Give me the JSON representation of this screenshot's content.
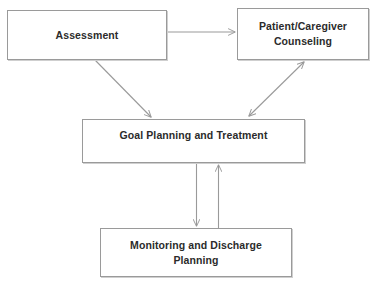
{
  "diagram": {
    "type": "flowchart",
    "canvas": {
      "width": 377,
      "height": 291,
      "background": "#ffffff"
    },
    "style": {
      "box_border_color": "#9a9a9a",
      "box_fill_color": "#ffffff",
      "box_shadow_color": "#cfcfcf",
      "text_color": "#2b2b2b",
      "arrow_color": "#9a9a9a"
    },
    "nodes": [
      {
        "id": "assessment",
        "label": "Assessment",
        "lines": [
          "Assessment"
        ],
        "x": 7,
        "y": 10,
        "width": 160,
        "height": 50
      },
      {
        "id": "counseling",
        "label": "Patient/Caregiver Counseling",
        "lines": [
          "Patient/Caregiver",
          "Counseling"
        ],
        "line1": "Patient/Caregiver",
        "line2": "Counseling",
        "x": 237,
        "y": 8,
        "width": 132,
        "height": 52
      },
      {
        "id": "goal-planning",
        "label": "Goal Planning and Treatment",
        "lines": [
          "Goal Planning and Treatment"
        ],
        "x": 82,
        "y": 119,
        "width": 223,
        "height": 44
      },
      {
        "id": "monitoring",
        "label": "Monitoring and Discharge Planning",
        "lines": [
          "Monitoring and Discharge",
          "Planning"
        ],
        "line1": "Monitoring and Discharge",
        "line2": "Planning",
        "x": 100,
        "y": 228,
        "width": 192,
        "height": 49
      }
    ],
    "edges": [
      {
        "id": "assessment-to-counseling",
        "from": "assessment",
        "to": "counseling",
        "direction": "one-way",
        "shape": "horizontal",
        "from_point": [
          167,
          32
        ],
        "to_point": [
          236,
          32
        ]
      },
      {
        "id": "assessment-to-goal",
        "from": "assessment",
        "to": "goal-planning",
        "direction": "one-way",
        "shape": "diagonal",
        "from_point": [
          95,
          60
        ],
        "to_point": [
          152,
          118
        ]
      },
      {
        "id": "goal-to-counseling",
        "from": "goal-planning",
        "to": "counseling",
        "direction": "two-way",
        "shape": "diagonal",
        "from_point": [
          248,
          116
        ],
        "to_point": [
          304,
          61
        ]
      },
      {
        "id": "goal-to-monitoring",
        "from": "goal-planning",
        "to": "monitoring",
        "direction": "one-way",
        "shape": "vertical",
        "from_point": [
          196,
          163
        ],
        "to_point": [
          196,
          227
        ]
      },
      {
        "id": "monitoring-to-goal",
        "from": "monitoring",
        "to": "goal-planning",
        "direction": "one-way",
        "shape": "vertical",
        "from_point": [
          218,
          228
        ],
        "to_point": [
          218,
          164
        ]
      }
    ]
  }
}
